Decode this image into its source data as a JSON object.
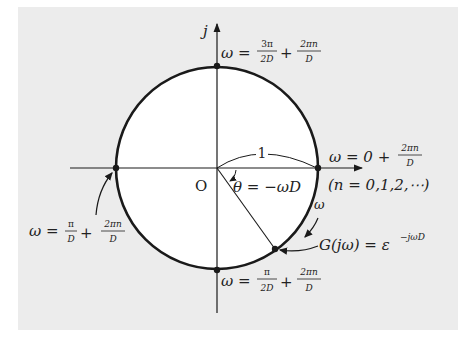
{
  "figure": {
    "axis_imag_label": "j",
    "origin_label": "O",
    "radius_label": "1",
    "angle_label": "θ = −ωD",
    "direction_label": "ω",
    "function_label": "G(jω) = ε",
    "function_exponent": "−jωD",
    "points": {
      "top": {
        "lhs": "ω =",
        "frac1_num": "3π",
        "frac1_den": "2D",
        "plus": "+",
        "frac2_num": "2πn",
        "frac2_den": "D"
      },
      "right": {
        "lhs": "ω = 0 +",
        "frac_num": "2πn",
        "frac_den": "D",
        "note": "(n = 0,1,2,⋯)"
      },
      "left": {
        "lhs": "ω =",
        "frac1_num": "π",
        "frac1_den": "D",
        "plus": "+",
        "frac2_num": "2πn",
        "frac2_den": "D"
      },
      "bottom": {
        "lhs": "ω =",
        "frac1_num": "π",
        "frac1_den": "2D",
        "plus": "+",
        "frac2_num": "2πn",
        "frac2_den": "D"
      }
    },
    "colors": {
      "panel": "#ececec",
      "circle_fill": "#ffffff",
      "stroke": "#1a1a1a"
    }
  }
}
